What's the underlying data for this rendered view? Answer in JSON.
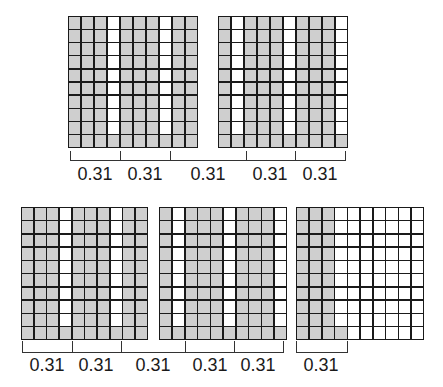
{
  "colors": {
    "shaded": "#cfcfcf",
    "unshaded": "#ffffff",
    "line": "#1a1a1a"
  },
  "grids": [
    {
      "id": "grid-1",
      "x": 68,
      "y": 16,
      "w": 130,
      "h": 132,
      "rows": 10,
      "cols": 10,
      "white_cols": [
        4,
        8
      ],
      "white_rows_upto": 9,
      "shaded_cells": 82,
      "pattern": "cols-white"
    },
    {
      "id": "grid-2",
      "x": 218,
      "y": 16,
      "w": 130,
      "h": 132,
      "rows": 10,
      "cols": 10,
      "white_cols": [
        2,
        6,
        10
      ],
      "white_rows_upto": 9,
      "shaded_cells": 73,
      "pattern": "cols-white"
    },
    {
      "id": "grid-3",
      "x": 21,
      "y": 207,
      "w": 127,
      "h": 133,
      "rows": 10,
      "cols": 10,
      "white_cols": [
        4,
        8
      ],
      "white_rows_upto": 9,
      "shaded_cells": 82,
      "pattern": "cols-white"
    },
    {
      "id": "grid-4",
      "x": 159,
      "y": 207,
      "w": 128,
      "h": 133,
      "rows": 10,
      "cols": 10,
      "white_cols": [
        2,
        6,
        10
      ],
      "white_rows_upto": 9,
      "shaded_cells": 73,
      "pattern": "cols-white"
    },
    {
      "id": "grid-5",
      "x": 296,
      "y": 207,
      "w": 128,
      "h": 133,
      "rows": 10,
      "cols": 10,
      "shaded_full_cols": 3,
      "shaded_extra_bottom_cells": 1,
      "shaded_cells": 31,
      "pattern": "partial"
    }
  ],
  "brackets": [
    {
      "y": 160,
      "tick_top": 151,
      "ticks": [
        70,
        120,
        170,
        246,
        295,
        345
      ]
    },
    {
      "y": 352,
      "tick_top": 341,
      "ticks": [
        22,
        72,
        121,
        185,
        234,
        283
      ]
    },
    {
      "y": 352,
      "tick_top": 341,
      "ticks": [
        296,
        347
      ]
    }
  ],
  "labels_top": [
    {
      "text": "0.31",
      "x": 95
    },
    {
      "text": "0.31",
      "x": 145
    },
    {
      "text": "0.31",
      "x": 208
    },
    {
      "text": "0.31",
      "x": 270
    },
    {
      "text": "0.31",
      "x": 320
    }
  ],
  "labels_bottom": [
    {
      "text": "0.31",
      "x": 47
    },
    {
      "text": "0.31",
      "x": 96
    },
    {
      "text": "0.31",
      "x": 153
    },
    {
      "text": "0.31",
      "x": 210
    },
    {
      "text": "0.31",
      "x": 258
    },
    {
      "text": "0.31",
      "x": 321
    }
  ],
  "labels_top_y": 164,
  "labels_bottom_y": 355
}
